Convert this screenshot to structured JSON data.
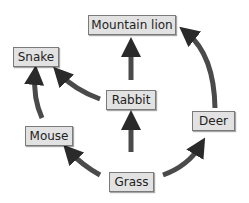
{
  "diagram": {
    "type": "food-web",
    "nodes": {
      "mountain_lion": "Mountain lion",
      "snake": "Snake",
      "rabbit": "Rabbit",
      "deer": "Deer",
      "mouse": "Mouse",
      "grass": "Grass"
    },
    "edges": [
      {
        "from": "Grass",
        "to": "Mouse"
      },
      {
        "from": "Grass",
        "to": "Rabbit"
      },
      {
        "from": "Grass",
        "to": "Deer"
      },
      {
        "from": "Mouse",
        "to": "Snake"
      },
      {
        "from": "Rabbit",
        "to": "Snake"
      },
      {
        "from": "Rabbit",
        "to": "Mountain lion"
      },
      {
        "from": "Deer",
        "to": "Mountain lion"
      }
    ],
    "colors": {
      "box_fill": "#e2e2e2",
      "box_border": "#7a7a7a",
      "arrow": "#2a2a2a"
    }
  }
}
